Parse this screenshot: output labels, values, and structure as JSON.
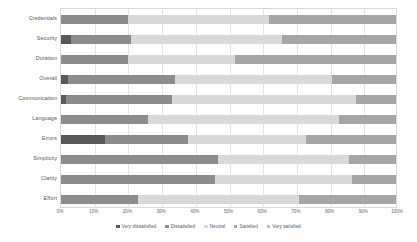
{
  "chart_data": {
    "type": "bar",
    "orientation": "horizontal",
    "stacked": true,
    "stack_mode": "percent",
    "title": "",
    "xlabel": "",
    "ylabel": "",
    "xlim": [
      0,
      100
    ],
    "grid": true,
    "legend_position": "bottom",
    "tick_labels": [
      "0%",
      "10%",
      "20%",
      "30%",
      "40%",
      "50%",
      "60%",
      "70%",
      "80%",
      "90%",
      "100%"
    ],
    "tick_values": [
      0,
      10,
      20,
      30,
      40,
      50,
      60,
      70,
      80,
      90,
      100
    ],
    "categories": [
      "Credentials",
      "Security",
      "Duration",
      "Overall",
      "Communication",
      "Language",
      "Errors",
      "Simplicity",
      "Clarity",
      "Effort"
    ],
    "series": [
      {
        "name": "Very dissatisfied",
        "color": "#595959",
        "values": [
          0.0,
          3.0,
          0.0,
          2.0,
          1.5,
          0.0,
          13.0,
          0.0,
          0.0,
          0.0
        ]
      },
      {
        "name": "Dissatisfied",
        "color": "#8c8c8c",
        "values": [
          20.0,
          18.0,
          20.0,
          32.0,
          31.5,
          26.0,
          25.0,
          47.0,
          46.0,
          23.0
        ]
      },
      {
        "name": "Neutral",
        "color": "#d9d9d9",
        "values": [
          42.0,
          45.0,
          32.0,
          47.0,
          55.0,
          57.0,
          35.0,
          39.0,
          41.0,
          48.0
        ]
      },
      {
        "name": "Satisfied",
        "color": "#a6a6a6",
        "values": [
          38.0,
          34.0,
          48.0,
          19.0,
          12.0,
          17.0,
          27.0,
          14.0,
          13.0,
          29.0
        ]
      },
      {
        "name": "Very satisfied",
        "color": "#bfbfbf",
        "values": [
          0.0,
          0.0,
          0.0,
          0.0,
          0.0,
          0.0,
          0.0,
          0.0,
          0.0,
          0.0
        ]
      }
    ]
  },
  "legend": {
    "items": [
      {
        "label": "Very dissatisfied",
        "color": "#595959"
      },
      {
        "label": "Dissatisfied",
        "color": "#8c8c8c"
      },
      {
        "label": "Neutral",
        "color": "#d9d9d9"
      },
      {
        "label": "Satisfied",
        "color": "#a6a6a6"
      },
      {
        "label": "Very satisfied",
        "color": "#bfbfbf"
      }
    ]
  }
}
